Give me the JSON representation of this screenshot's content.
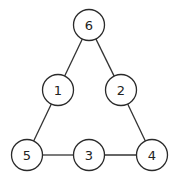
{
  "diagram": {
    "type": "graph",
    "node_radius": 15.5,
    "colors": {
      "stroke": "#2a2a2a",
      "fill": "#ffffff",
      "text": "#222222"
    },
    "nodes": [
      {
        "id": "6",
        "label": "6",
        "x": 89,
        "y": 25
      },
      {
        "id": "1",
        "label": "1",
        "x": 58,
        "y": 90
      },
      {
        "id": "2",
        "label": "2",
        "x": 121,
        "y": 90
      },
      {
        "id": "5",
        "label": "5",
        "x": 27,
        "y": 155
      },
      {
        "id": "3",
        "label": "3",
        "x": 89,
        "y": 155
      },
      {
        "id": "4",
        "label": "4",
        "x": 152,
        "y": 155
      }
    ],
    "edges": [
      {
        "from": "6",
        "to": "1"
      },
      {
        "from": "6",
        "to": "2"
      },
      {
        "from": "1",
        "to": "5"
      },
      {
        "from": "2",
        "to": "4"
      },
      {
        "from": "5",
        "to": "3"
      },
      {
        "from": "3",
        "to": "4"
      }
    ]
  }
}
